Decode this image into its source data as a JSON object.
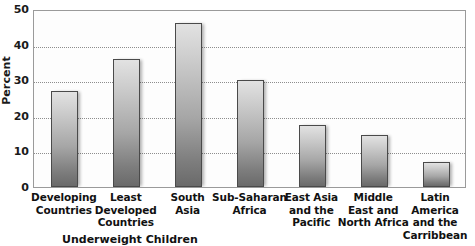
{
  "chart_data": {
    "type": "bar",
    "title": "",
    "xlabel": "",
    "ylabel": "Percent",
    "ylim": [
      0,
      50
    ],
    "yticks": [
      0,
      10,
      20,
      30,
      40,
      50
    ],
    "grid": "horizontal-dotted",
    "legend": "none",
    "categories": [
      "Developing Countries",
      "Least Developed Countries",
      "South Asia",
      "Sub-Saharan Africa",
      "East Asia and the Pacific",
      "Middle East and North Africa",
      "Latin America and the Carribbean"
    ],
    "category_lines": [
      [
        "Developing",
        "Countries"
      ],
      [
        "Least",
        "Developed",
        "Countries"
      ],
      [
        "South",
        "Asia"
      ],
      [
        "Sub-Saharan",
        "Africa"
      ],
      [
        "East Asia",
        "and the",
        "Pacific"
      ],
      [
        "Middle",
        "East and",
        "North Africa"
      ],
      [
        "Latin America",
        "and the",
        "Carribbean"
      ]
    ],
    "values": [
      27,
      36,
      46,
      30,
      17.5,
      14.5,
      7
    ]
  },
  "axis": {
    "y_title": "Percent",
    "y_tick_labels": [
      "50",
      "40",
      "30",
      "20",
      "10",
      "0"
    ]
  },
  "caption": {
    "text": "Underweight Children"
  },
  "colors": {
    "bar_top": "#e2e2e2",
    "bar_bottom": "#6a6a6a",
    "bar_border": "#4a4a4a",
    "gridline": "#8d8d8d",
    "plot_border": "#9a9a9a",
    "text": "#111111",
    "background": "#ffffff"
  }
}
